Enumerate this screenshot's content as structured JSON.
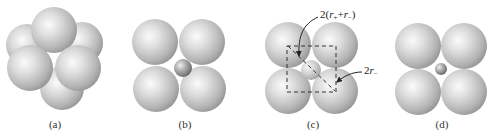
{
  "figure": {
    "colors": {
      "sphere_light": "#f4f4f4",
      "sphere_mid": "#c8c8c8",
      "sphere_dark": "#8c8c8c",
      "small_sphere_dark": "#6e6e6e",
      "dash_line": "#333333"
    },
    "panels": [
      {
        "id": "a",
        "label": "(a)",
        "label_x": 55
      },
      {
        "id": "b",
        "label": "(b)",
        "label_x": 185
      },
      {
        "id": "c",
        "label": "(c)",
        "label_x": 313
      },
      {
        "id": "d",
        "label": "(d)",
        "label_x": 442
      }
    ],
    "annotations": {
      "diagonal_label_prefix": "2(",
      "diagonal_r_plus": "r",
      "diagonal_plus_sub": "+",
      "diagonal_plus": "+",
      "diagonal_r_minus": "r",
      "diagonal_minus_sub": "−",
      "diagonal_label_suffix": ")",
      "edge_label_prefix": "2",
      "edge_r": "r",
      "edge_sub": "−"
    }
  }
}
